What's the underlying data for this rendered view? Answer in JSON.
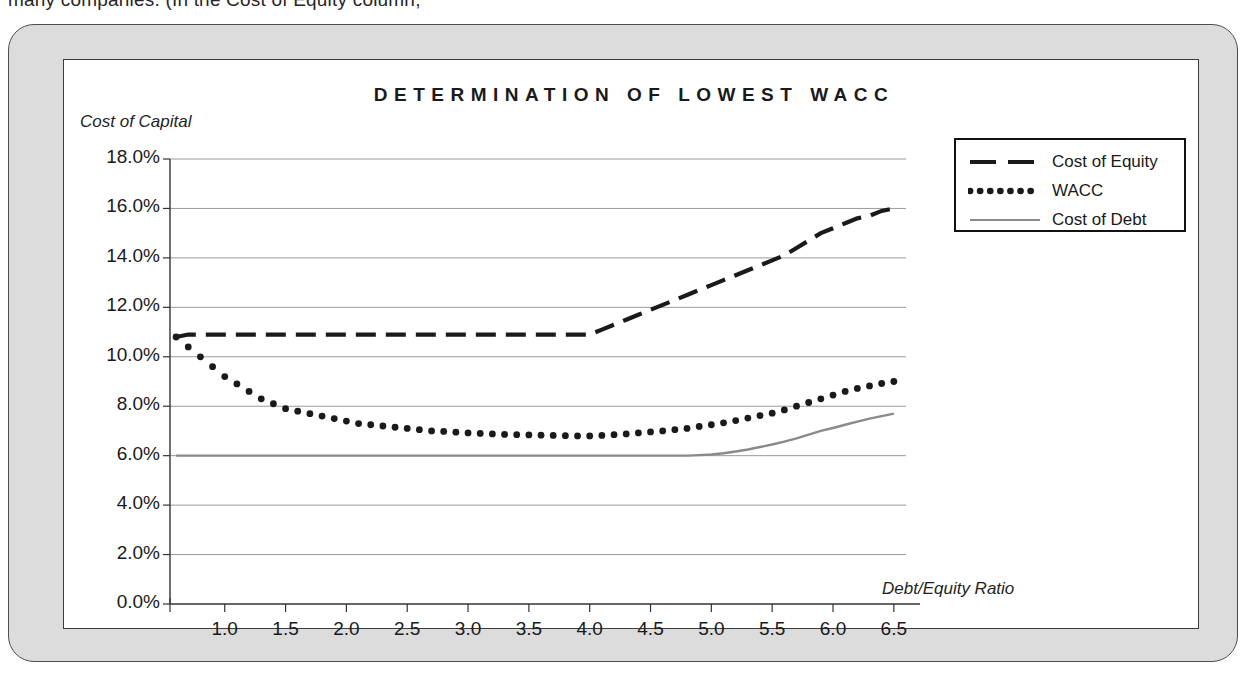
{
  "page_fragment": "many companies. (In the Cost of Equity column,",
  "chart": {
    "title": "DETERMINATION OF LOWEST WACC",
    "y_axis_title": "Cost of Capital",
    "x_axis_title": "Debt/Equity Ratio"
  },
  "legend": {
    "items": [
      {
        "label": "Cost of Equity",
        "style": "dashed",
        "color": "#1a1a1a"
      },
      {
        "label": "WACC",
        "style": "dotted",
        "color": "#1a1a1a"
      },
      {
        "label": "Cost of Debt",
        "style": "solid",
        "color": "#8a8a8a"
      }
    ]
  },
  "chart_data": {
    "type": "line",
    "title": "DETERMINATION OF LOWEST WACC",
    "xlabel": "Debt/Equity Ratio",
    "ylabel": "Cost of Capital",
    "xlim": [
      0.55,
      6.6
    ],
    "ylim": [
      0,
      18
    ],
    "grid": true,
    "legend_position": "top-right",
    "y_tick_labels": [
      "0.0%",
      "2.0%",
      "4.0%",
      "6.0%",
      "8.0%",
      "10.0%",
      "12.0%",
      "14.0%",
      "16.0%",
      "18.0%"
    ],
    "y_ticks": [
      0,
      2,
      4,
      6,
      8,
      10,
      12,
      14,
      16,
      18
    ],
    "x_tick_labels": [
      "1.0",
      "1.5",
      "2.0",
      "2.5",
      "3.0",
      "3.5",
      "4.0",
      "4.5",
      "5.0",
      "5.5",
      "6.0",
      "6.5"
    ],
    "x_ticks": [
      1.0,
      1.5,
      2.0,
      2.5,
      3.0,
      3.5,
      4.0,
      4.5,
      5.0,
      5.5,
      6.0,
      6.5
    ],
    "x": [
      0.6,
      0.7,
      0.8,
      0.9,
      1.0,
      1.1,
      1.2,
      1.3,
      1.4,
      1.5,
      1.6,
      1.7,
      1.8,
      1.9,
      2.0,
      2.1,
      2.2,
      2.3,
      2.4,
      2.5,
      2.6,
      2.7,
      2.8,
      2.9,
      3.0,
      3.1,
      3.2,
      3.3,
      3.4,
      3.5,
      3.6,
      3.7,
      3.8,
      3.9,
      4.0,
      4.1,
      4.2,
      4.3,
      4.4,
      4.5,
      4.6,
      4.7,
      4.8,
      4.9,
      5.0,
      5.1,
      5.2,
      5.3,
      5.4,
      5.5,
      5.6,
      5.7,
      5.8,
      5.9,
      6.0,
      6.1,
      6.2,
      6.3,
      6.4,
      6.5
    ],
    "series": [
      {
        "name": "Cost of Equity",
        "style": "dashed",
        "color": "#1a1a1a",
        "values": [
          10.8,
          10.9,
          10.9,
          10.9,
          10.9,
          10.9,
          10.9,
          10.9,
          10.9,
          10.9,
          10.9,
          10.9,
          10.9,
          10.9,
          10.9,
          10.9,
          10.9,
          10.9,
          10.9,
          10.9,
          10.9,
          10.9,
          10.9,
          10.9,
          10.9,
          10.9,
          10.9,
          10.9,
          10.9,
          10.9,
          10.9,
          10.9,
          10.9,
          10.9,
          10.9,
          11.1,
          11.3,
          11.5,
          11.7,
          11.9,
          12.1,
          12.3,
          12.5,
          12.7,
          12.9,
          13.1,
          13.3,
          13.5,
          13.7,
          13.9,
          14.1,
          14.4,
          14.7,
          15.0,
          15.2,
          15.4,
          15.6,
          15.7,
          15.9,
          16.0
        ]
      },
      {
        "name": "WACC",
        "style": "dotted",
        "color": "#1a1a1a",
        "values": [
          10.8,
          10.4,
          10.0,
          9.6,
          9.2,
          8.9,
          8.6,
          8.3,
          8.1,
          7.9,
          7.8,
          7.7,
          7.6,
          7.5,
          7.4,
          7.3,
          7.25,
          7.2,
          7.15,
          7.1,
          7.05,
          7.0,
          6.98,
          6.95,
          6.92,
          6.9,
          6.88,
          6.86,
          6.85,
          6.84,
          6.83,
          6.82,
          6.81,
          6.8,
          6.8,
          6.82,
          6.85,
          6.88,
          6.92,
          6.96,
          7.0,
          7.05,
          7.1,
          7.18,
          7.25,
          7.33,
          7.42,
          7.52,
          7.62,
          7.72,
          7.85,
          8.0,
          8.15,
          8.3,
          8.45,
          8.6,
          8.72,
          8.82,
          8.92,
          9.0
        ]
      },
      {
        "name": "Cost of Debt",
        "style": "solid",
        "color": "#8a8a8a",
        "values": [
          6.0,
          6.0,
          6.0,
          6.0,
          6.0,
          6.0,
          6.0,
          6.0,
          6.0,
          6.0,
          6.0,
          6.0,
          6.0,
          6.0,
          6.0,
          6.0,
          6.0,
          6.0,
          6.0,
          6.0,
          6.0,
          6.0,
          6.0,
          6.0,
          6.0,
          6.0,
          6.0,
          6.0,
          6.0,
          6.0,
          6.0,
          6.0,
          6.0,
          6.0,
          6.0,
          6.0,
          6.0,
          6.0,
          6.0,
          6.0,
          6.0,
          6.0,
          6.0,
          6.02,
          6.05,
          6.1,
          6.17,
          6.25,
          6.35,
          6.45,
          6.57,
          6.7,
          6.85,
          7.0,
          7.12,
          7.25,
          7.38,
          7.5,
          7.6,
          7.7
        ]
      }
    ]
  }
}
